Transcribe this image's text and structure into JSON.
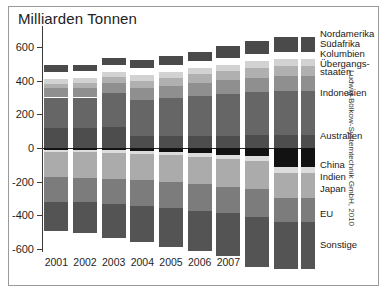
{
  "title": "Milliarden Tonnen",
  "credit": "Ludwig-Bölkow-Systemtechnik GmbH, 2010",
  "axis": {
    "yticks": [
      "600",
      "400",
      "200",
      "0",
      "-200",
      "-400",
      "-600"
    ],
    "xticks": [
      "2001",
      "2002",
      "2003",
      "2004",
      "2005",
      "2006",
      "2007",
      "2008",
      "2009"
    ]
  },
  "legend": [
    {
      "label": "Nordamerika",
      "color": "#4a4a4a"
    },
    {
      "label": "Südafrika",
      "color": "#d2d2d2"
    },
    {
      "label": "Kolumbien",
      "color": "#b0b0b0"
    },
    {
      "label": "Übergangs-",
      "color": "#8f8f8f"
    },
    {
      "label": "staaten",
      "color": "#8f8f8f"
    },
    {
      "label": "Indonesien",
      "color": "#666666"
    },
    {
      "label": "Australien",
      "color": "#4d4d4d"
    },
    {
      "label": "China",
      "color": "#121212"
    },
    {
      "label": "Indien",
      "color": "#dcdcdc"
    },
    {
      "label": "Japan",
      "color": "#ababab"
    },
    {
      "label": "EU",
      "color": "#7c7c7c"
    },
    {
      "label": "Sonstige",
      "color": "#545454"
    }
  ],
  "chart_data": {
    "type": "bar",
    "title": "Milliarden Tonnen",
    "subtitle": "",
    "xlabel": "",
    "ylabel": "Milliarden Tonnen",
    "ylim": [
      -700,
      700
    ],
    "grid": false,
    "legend_position": "right",
    "stacked": true,
    "diverging": true,
    "categories": [
      "2001",
      "2002",
      "2003",
      "2004",
      "2005",
      "2006",
      "2007",
      "2008",
      "2009"
    ],
    "series": [
      {
        "name": "Nordamerika",
        "color": "#4a4a4a",
        "sign": "positive",
        "detached": true,
        "values": [
          40,
          40,
          45,
          50,
          55,
          58,
          70,
          80,
          90
        ]
      },
      {
        "name": "Südafrika",
        "color": "#d2d2d2",
        "sign": "positive",
        "values": [
          30,
          30,
          32,
          34,
          35,
          36,
          38,
          40,
          40
        ]
      },
      {
        "name": "Kolumbien",
        "color": "#b0b0b0",
        "sign": "positive",
        "values": [
          25,
          26,
          32,
          42,
          48,
          52,
          56,
          60,
          62
        ]
      },
      {
        "name": "Übergangsstaaten",
        "color": "#8f8f8f",
        "sign": "positive",
        "values": [
          55,
          58,
          62,
          70,
          74,
          78,
          82,
          86,
          88
        ]
      },
      {
        "name": "Indonesien",
        "color": "#666666",
        "sign": "positive",
        "values": [
          180,
          180,
          200,
          215,
          225,
          235,
          245,
          255,
          260
        ]
      },
      {
        "name": "Australien",
        "color": "#4d4d4d",
        "sign": "positive",
        "values": [
          120,
          120,
          125,
          70,
          70,
          72,
          74,
          76,
          78
        ]
      },
      {
        "name": "China",
        "color": "#121212",
        "sign": "negative",
        "values": [
          -12,
          -12,
          -14,
          -18,
          -26,
          -32,
          -40,
          -50,
          -115
        ]
      },
      {
        "name": "Indien",
        "color": "#dcdcdc",
        "sign": "negative",
        "values": [
          -12,
          -12,
          -14,
          -16,
          -18,
          -20,
          -24,
          -28,
          -32
        ]
      },
      {
        "name": "Japan",
        "color": "#ababab",
        "sign": "negative",
        "values": [
          -150,
          -152,
          -155,
          -158,
          -160,
          -162,
          -165,
          -168,
          -150
        ]
      },
      {
        "name": "EU",
        "color": "#7c7c7c",
        "sign": "negative",
        "values": [
          -145,
          -146,
          -150,
          -152,
          -155,
          -158,
          -160,
          -162,
          -140
        ]
      },
      {
        "name": "Sonstige",
        "color": "#545454",
        "sign": "negative",
        "values": [
          -175,
          -180,
          -200,
          -215,
          -230,
          -240,
          -255,
          -300,
          -280
        ]
      }
    ]
  }
}
